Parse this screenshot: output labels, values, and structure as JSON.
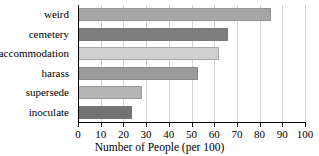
{
  "chart_data": {
    "type": "bar",
    "orientation": "horizontal",
    "title": "",
    "xlabel": "Number of People (per 100)",
    "ylabel": "",
    "categories": [
      "weird",
      "cemetery",
      "accommodation",
      "harass",
      "supersede",
      "inoculate"
    ],
    "values": [
      85,
      66,
      62,
      53,
      28,
      24
    ],
    "bar_colors": [
      "#a6a6a6",
      "#7d7d7d",
      "#cfcfcf",
      "#9a9a9a",
      "#b5b5b5",
      "#737373"
    ],
    "xlim": [
      0,
      100
    ],
    "xticks": [
      0,
      10,
      20,
      30,
      40,
      50,
      60,
      70,
      80,
      90,
      100
    ],
    "xticklabels": [
      "0",
      "10",
      "20",
      "30",
      "40",
      "50",
      "60",
      "70",
      "80",
      "90",
      "100"
    ],
    "grid": true,
    "grid_axis": "x",
    "grid_color": "#d2d2d2",
    "legend": false,
    "axis_color": "#000000",
    "background": "#ffffff"
  }
}
